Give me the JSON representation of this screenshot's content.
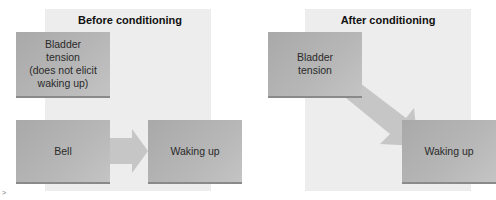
{
  "panels": {
    "before": {
      "title": "Before conditioning",
      "boxes": {
        "bladder": "Bladder\ntension\n(does not elicit\nwaking up)",
        "bell": "Bell",
        "waking": "Waking up"
      }
    },
    "after": {
      "title": "After conditioning",
      "boxes": {
        "bladder": "Bladder\ntension",
        "waking": "Waking up"
      }
    }
  },
  "corner_mark": ">",
  "colors": {
    "panel_bg": "#ededed",
    "box_fill": "#b3b3b3",
    "arrow_fill": "#c4c4c4",
    "title_text": "#111111",
    "box_text": "#2a2a2a"
  }
}
